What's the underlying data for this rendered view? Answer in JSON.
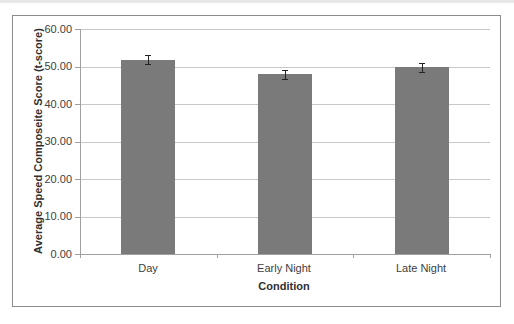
{
  "chart_data": {
    "type": "bar",
    "title": "",
    "xlabel": "Condition",
    "ylabel": "Average Speed Composeite Score (t-score)",
    "categories": [
      "Day",
      "Early Night",
      "Late Night"
    ],
    "values": [
      51.8,
      48.0,
      49.8
    ],
    "error_bars": [
      1.2,
      1.2,
      1.2
    ],
    "ylim": [
      0,
      60
    ],
    "yticks": [
      "0.00",
      "10.00",
      "20.00",
      "30.00",
      "40.00",
      "50.00",
      "60.00"
    ],
    "grid": true,
    "legend": null,
    "bar_color": "#7a7a7a"
  },
  "axis": {
    "x_title": "Condition",
    "y_title": "Average Speed Composeite Score (t-score)",
    "y_ticks": [
      "60.00",
      "50.00",
      "40.00",
      "30.00",
      "20.00",
      "10.00",
      "0.00"
    ],
    "categories": [
      "Day",
      "Early Night",
      "Late Night"
    ]
  }
}
